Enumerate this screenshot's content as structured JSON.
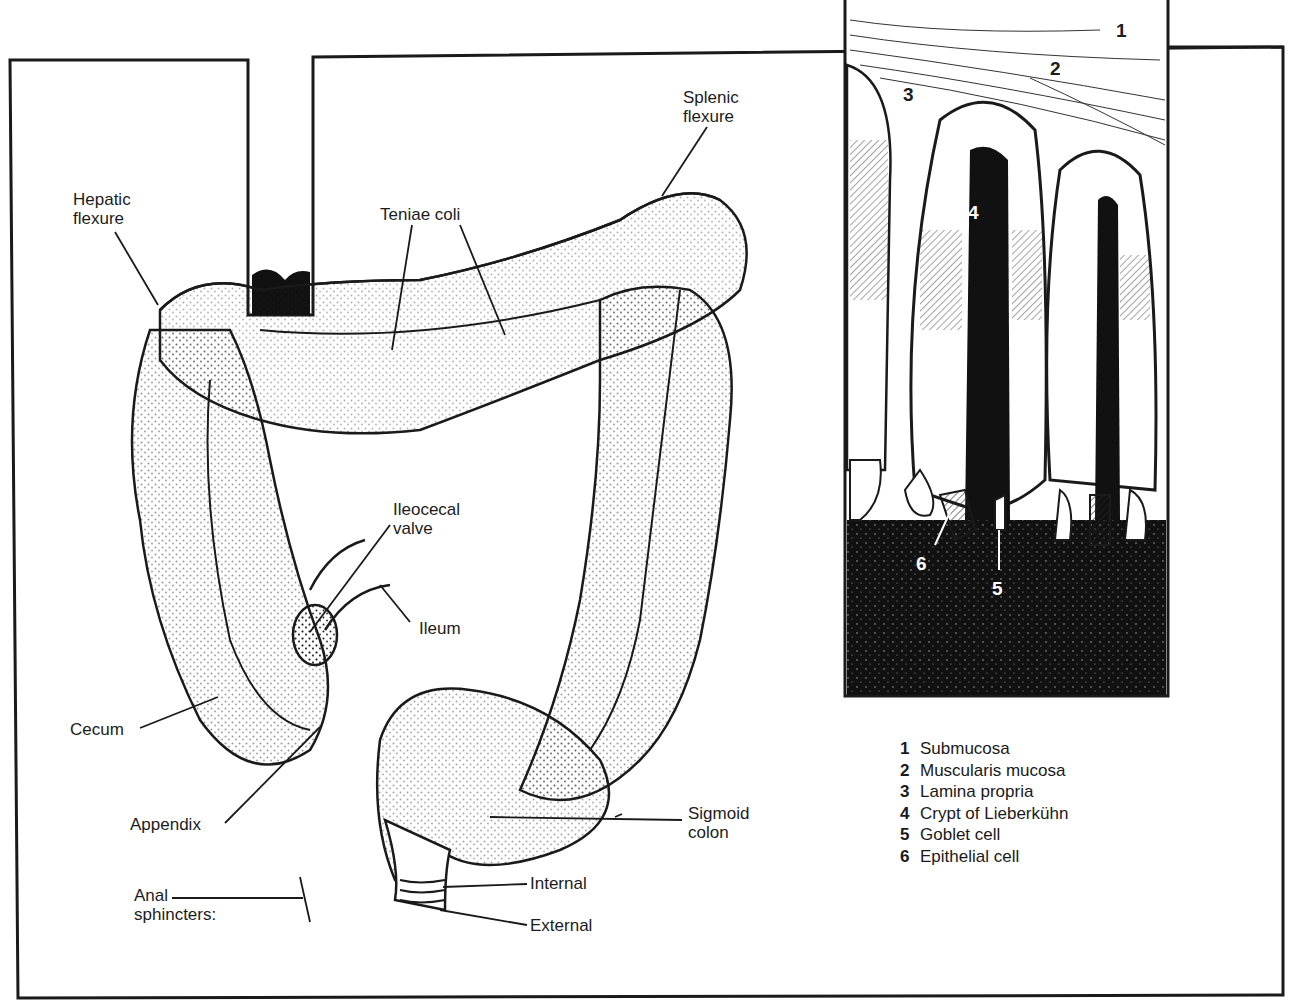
{
  "figure": {
    "gross_labels": {
      "hepatic_flexure": "Hepatic\nflexure",
      "teniae_coli": "Teniae coli",
      "splenic_flexure": "Splenic\nflexure",
      "ileocecal_valve": "Ileocecal\nvalve",
      "ileum": "Ileum",
      "cecum": "Cecum",
      "appendix": "Appendix",
      "sigmoid_colon": "Sigmoid\ncolon",
      "anal_sphincters": "Anal\nsphincters:",
      "internal": "Internal",
      "external": "External"
    },
    "inset_markers": [
      "1",
      "2",
      "3",
      "4",
      "5",
      "6"
    ],
    "legend": [
      {
        "num": "1",
        "label": "Submucosa"
      },
      {
        "num": "2",
        "label": "Muscularis mucosa"
      },
      {
        "num": "3",
        "label": "Lamina propria"
      },
      {
        "num": "4",
        "label": "Crypt of Lieberkühn"
      },
      {
        "num": "5",
        "label": "Goblet cell"
      },
      {
        "num": "6",
        "label": "Epithelial cell"
      }
    ],
    "colors": {
      "ink": "#1a1a1a",
      "paper": "#ffffff"
    }
  }
}
